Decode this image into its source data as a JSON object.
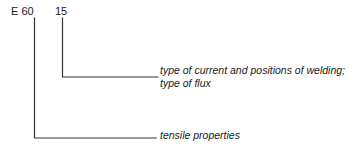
{
  "diagram": {
    "type": "welding-electrode-designation-callout",
    "background_color": "#ffffff",
    "line_color": "#333333",
    "text_color": "#1a1a1a",
    "codes": [
      {
        "id": "electrode-strength",
        "label": "E 60",
        "leader": {
          "x": 34,
          "y_top": 18,
          "y_elbow": 138,
          "x_end": 156
        },
        "callout_id": "tensile"
      },
      {
        "id": "classification-digits",
        "label": "15",
        "leader": {
          "x": 62,
          "y_top": 18,
          "y_elbow": 77,
          "x_end": 158
        },
        "callout_id": "current-flux"
      }
    ],
    "callouts": [
      {
        "id": "current-flux",
        "lines": [
          "type of current and positions of welding;",
          "type of flux"
        ]
      },
      {
        "id": "tensile",
        "lines": [
          "tensile properties"
        ]
      }
    ]
  }
}
